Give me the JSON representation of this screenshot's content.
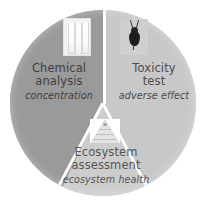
{
  "figure": {
    "type": "three-sector-circle-diagram",
    "shape": "circle",
    "segment_count": 3
  },
  "segments": [
    {
      "id": "chemical-analysis",
      "title_line1": "Chemical",
      "title_line2": "analysis",
      "subtitle": "concentration",
      "fill_color": "#9a9a9a",
      "icon": "cuvettes-photo-icon",
      "position": "left"
    },
    {
      "id": "toxicity-test",
      "title_line1": "Toxicity",
      "title_line2": "test",
      "subtitle": "adverse effect",
      "fill_color": "#c8c8c8",
      "icon": "insect-photo-icon",
      "position": "right"
    },
    {
      "id": "ecosystem-assessment",
      "title_line1": "Ecosystem",
      "title_line2": "assessment",
      "subtitle": "ecosystem health",
      "fill_color": "#cdcdcd",
      "icon": "ecological-pyramid-icon",
      "position": "bottom"
    }
  ],
  "colors": {
    "background": "#ffffff",
    "divider": "#ffffff",
    "text": "#4a4a4a"
  }
}
